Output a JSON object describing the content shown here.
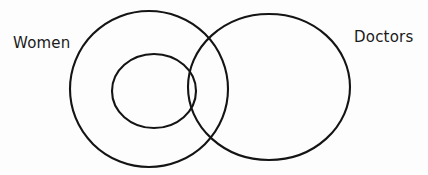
{
  "diagram": {
    "type": "venn-diagram",
    "title": "",
    "background_color": "#fdfdfd",
    "stroke_color": "#141414",
    "stroke_width": 2.1,
    "labels": {
      "left": "Women",
      "right": "Doctors"
    },
    "sets": [
      {
        "name": "Women",
        "shape": "ellipse",
        "cx": 149,
        "cy": 89,
        "rx": 79,
        "ry": 78
      },
      {
        "name": "inner-subset",
        "shape": "ellipse",
        "cx": 154,
        "cy": 91,
        "rx": 42,
        "ry": 37
      },
      {
        "name": "Doctors",
        "shape": "ellipse",
        "cx": 269,
        "cy": 87,
        "rx": 81,
        "ry": 73
      }
    ]
  }
}
